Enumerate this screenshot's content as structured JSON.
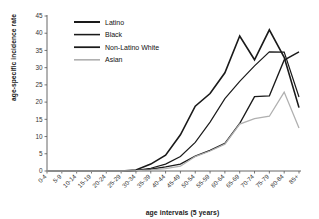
{
  "chart_data": {
    "type": "line",
    "title": "",
    "xlabel": "age intervals (5 years)",
    "ylabel": "age-specific incidence rate",
    "ylim": [
      0,
      45
    ],
    "ytick_step": 5,
    "yticks": [
      "0",
      "5",
      "10",
      "15",
      "20",
      "25",
      "30",
      "35",
      "40",
      "45"
    ],
    "grid": false,
    "legend_position": "top-center-inside",
    "categories": [
      "0-4",
      "5-9",
      "10-14",
      "15-19",
      "20-24",
      "25-29",
      "30-34",
      "35-39",
      "40-44",
      "45-49",
      "50-54",
      "55-59",
      "60-64",
      "65-69",
      "70-74",
      "75-79",
      "80-84",
      "85+"
    ],
    "series": [
      {
        "name": "Latino",
        "color": "#1a1a1a",
        "width": 1.6,
        "values": [
          0,
          0,
          0,
          0,
          0,
          0,
          0.3,
          2.0,
          4.6,
          10.5,
          18.8,
          22.5,
          28.5,
          39.2,
          32.3,
          41.0,
          33.0,
          18.4
        ]
      },
      {
        "name": "Black",
        "color": "#1a1a1a",
        "width": 1.2,
        "values": [
          0,
          0,
          0,
          0,
          0,
          0,
          0.2,
          0.8,
          2.0,
          4.2,
          8.3,
          14.2,
          21.0,
          26.0,
          30.5,
          34.6,
          34.5,
          21.5
        ]
      },
      {
        "name": "Non-Latino White",
        "color": "#1a1a1a",
        "width": 1.4,
        "values": [
          0,
          0,
          0,
          0,
          0,
          0,
          0.1,
          0.5,
          1.2,
          2.0,
          4.3,
          6.0,
          8.0,
          13.8,
          21.6,
          21.8,
          32.2,
          34.6
        ]
      },
      {
        "name": "Asian",
        "color": "#b0b0b0",
        "width": 1.3,
        "values": [
          0,
          0,
          0,
          0,
          0,
          0,
          0.1,
          0.3,
          0.7,
          1.4,
          4.2,
          5.8,
          7.8,
          13.6,
          15.2,
          15.9,
          22.9,
          12.5
        ]
      }
    ]
  },
  "legend": {
    "entries": [
      {
        "label": "Latino"
      },
      {
        "label": "Black"
      },
      {
        "label": "Non-Latino White"
      },
      {
        "label": "Asian"
      }
    ]
  }
}
